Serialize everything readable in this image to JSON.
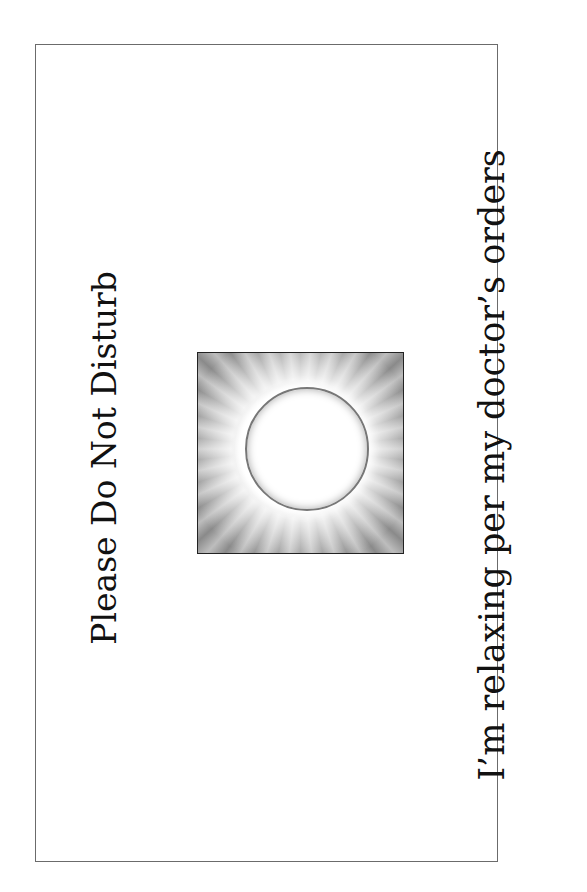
{
  "sign": {
    "heading": "Please Do Not Disturb",
    "message": "I’m relaxing per my doctor’s orders",
    "image": {
      "icon": "sun-eclipse-icon",
      "border_color": "#222222",
      "ray_color": "#8a8a8a"
    },
    "frame_color": "#6b6b6b"
  }
}
